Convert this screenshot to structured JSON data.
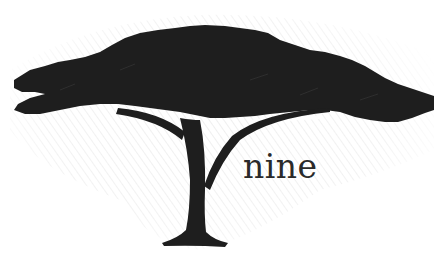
{
  "illustration": {
    "subject": "acacia-tree-silhouette",
    "caption": "nine",
    "colors": {
      "background": "#ffffff",
      "tree": "#1e1e1e",
      "hatching": "#9a9a9a",
      "caption": "#2a2a2a"
    }
  }
}
